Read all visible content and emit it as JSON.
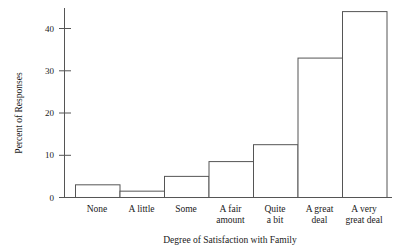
{
  "chart_data": {
    "type": "bar",
    "title": "",
    "subtitle": "",
    "xlabel": "Degree of Satisfaction with Family",
    "ylabel": "Percent of Responses",
    "categories": [
      "None",
      "A little",
      "Some",
      "A fair amount",
      "Quite a bit",
      "A great deal",
      "A very great deal"
    ],
    "category_lines": [
      [
        "None"
      ],
      [
        "A little"
      ],
      [
        "Some"
      ],
      [
        "A fair",
        "amount"
      ],
      [
        "Quite",
        "a bit"
      ],
      [
        "A great",
        "deal"
      ],
      [
        "A very",
        "great deal"
      ]
    ],
    "values": [
      3,
      1.5,
      5,
      8.5,
      12.5,
      33,
      44
    ],
    "ylim": [
      0,
      46
    ],
    "yticks": [
      0,
      10,
      20,
      30,
      40
    ],
    "ytick_labels": [
      "0",
      "10",
      "20",
      "30",
      "40"
    ],
    "grid": false,
    "legend": false,
    "bar_style": "outline",
    "bar_gap": 0,
    "colors": {
      "bar_fill": "#ffffff",
      "bar_stroke": "#555555",
      "axis": "#555555",
      "text": "#1a1a1a",
      "background": "#ffffff"
    }
  }
}
